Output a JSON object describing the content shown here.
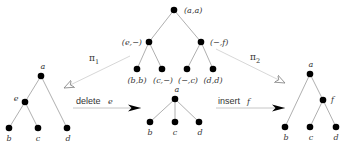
{
  "diagram": {
    "top_tree": {
      "root": "(a,a)",
      "left_child": "(e,−)",
      "right_child": "(−,f)",
      "leaves": [
        "(b,b)",
        "(c,−)",
        "(−,c)",
        "(d,d)"
      ]
    },
    "left_tree": {
      "root": "a",
      "inner": "e",
      "leaves": [
        "b",
        "c",
        "d"
      ]
    },
    "middle_tree": {
      "root": "a",
      "leaves": [
        "b",
        "c",
        "d"
      ]
    },
    "right_tree": {
      "root": "a",
      "inner": "f",
      "leaves": [
        "b",
        "c",
        "d"
      ]
    },
    "projections": {
      "pi1": {
        "symbol": "π",
        "subscript": "1"
      },
      "pi2": {
        "symbol": "π",
        "subscript": "2"
      }
    },
    "operations": {
      "delete": {
        "verb": "delete",
        "arg": "e"
      },
      "insert": {
        "verb": "insert",
        "arg": "f"
      }
    },
    "colors": {
      "node": "#000000",
      "edge": "#9a9a9a",
      "projection_arrow": "#d2d2d2",
      "operation_arrow": "#b8b8b8"
    }
  }
}
